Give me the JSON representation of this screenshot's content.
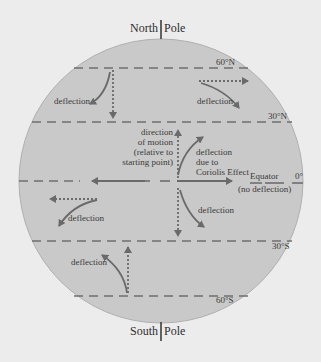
{
  "poles": {
    "north_left": "North",
    "north_right": "Pole",
    "south_left": "South",
    "south_right": "Pole"
  },
  "latitudes": {
    "n60": "60°N",
    "n30": "30°N",
    "equator_deg": "0°",
    "s30": "30°S",
    "s60": "60°S"
  },
  "equator": {
    "label": "Equator",
    "note": "(no deflection)"
  },
  "center_labels": {
    "direction_line1": "direction",
    "direction_line2": "of motion",
    "direction_line3": "(relative to",
    "direction_line4": "starting point)",
    "coriolis_line1": "deflection",
    "coriolis_line2": "due to",
    "coriolis_line3": "Coriolis Effect"
  },
  "deflection_labels": {
    "nw": "deflection",
    "ne": "deflection",
    "w": "deflection",
    "se": "deflection",
    "sw": "deflection"
  },
  "colors": {
    "background": "#ececec",
    "globe": "#c9c9c9",
    "line": "#6f6f6f",
    "arrow": "#6a6a6a",
    "text": "#3a3a3a"
  }
}
